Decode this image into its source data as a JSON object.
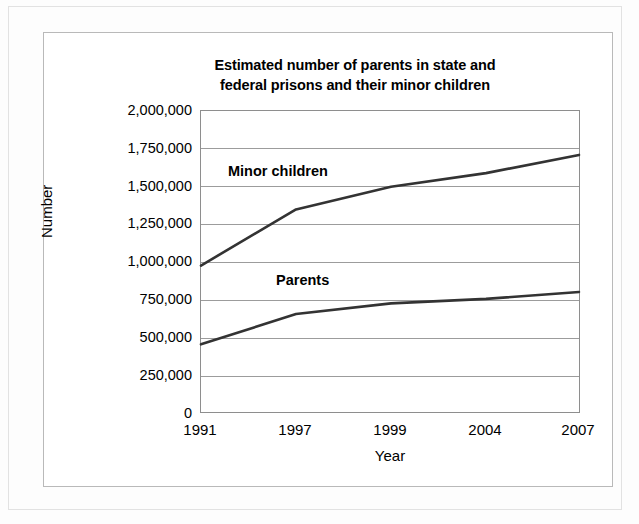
{
  "chart_data": {
    "type": "line",
    "title": "Estimated number of parents in state and federal prisons and their minor children",
    "title_line1": "Estimated number of parents in state and",
    "title_line2": "federal prisons and their minor children",
    "xlabel": "Year",
    "ylabel": "Number",
    "categories": [
      "1991",
      "1997",
      "1999",
      "2004",
      "2007"
    ],
    "series": [
      {
        "name": "Minor children",
        "values": [
          980000,
          1350000,
          1500000,
          1590000,
          1710000
        ]
      },
      {
        "name": "Parents",
        "values": [
          460000,
          660000,
          730000,
          760000,
          805000
        ]
      }
    ],
    "ylim": [
      0,
      2000000
    ],
    "y_ticks": [
      2000000,
      1750000,
      1500000,
      1250000,
      1000000,
      750000,
      500000,
      250000,
      0
    ],
    "y_tick_labels": [
      "2,000,000",
      "1,750,000",
      "1,500,000",
      "1,250,000",
      "1,000,000",
      "750,000",
      "500,000",
      "250,000",
      "0"
    ],
    "grid": true,
    "legend": "inline-labels",
    "line_color": "#333333",
    "grid_color": "#9c9c9c",
    "frame_color": "#8e8e8e"
  }
}
